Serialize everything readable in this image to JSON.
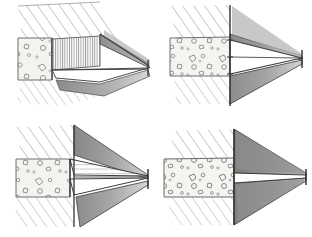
{
  "figure": {
    "medium": "graphite pencil drawing",
    "background_color": "#ffffff",
    "layout": {
      "rows": 2,
      "columns": 2,
      "panel_width": 156,
      "panel_height": 118
    },
    "ink_color": "#2b2b2b",
    "hatch_color": "#8c8c8c",
    "shade_light": "#c9c9c9",
    "shade_mid": "#a0a0a0",
    "shade_dark": "#6e6e6e",
    "aggregate_fill": "#f4f2ee",
    "void_fill": "#ffffff"
  },
  "panels": [
    {
      "id": "panel-top-left",
      "position": "top-left",
      "description": "Wide blunt wedge opening; aggregate block at left, fine vertical striations across the wedge face, long dark shaded flanks receding to the right.",
      "features": {
        "aggregate_zone": "left block with pebble inclusions",
        "hatched_zone": "diagonal hatching above and below",
        "striations": "dense vertical comb lines on wedge face",
        "wedge_type": "blunt / open",
        "tip_location": "right edge, mid height"
      }
    },
    {
      "id": "panel-top-right",
      "position": "top-right",
      "description": "Narrow sharp wedge; aggregate block at left with many pebbles, vertical boundary line, two dark shaded cones converging to a single sharp point at the right.",
      "features": {
        "aggregate_zone": "left block with pebble inclusions",
        "hatched_zone": "diagonal hatching above and below",
        "striations": "none",
        "wedge_type": "sharp / closed",
        "tip_location": "far right, mid height"
      }
    },
    {
      "id": "panel-bottom-left",
      "position": "bottom-left",
      "description": "Stepped double wedge; aggregate block at left, a short upper flap and a lower flap both tapering right to a common point, dark shading above and below.",
      "features": {
        "aggregate_zone": "left block with pebble inclusions",
        "hatched_zone": "diagonal hatching above and below",
        "striations": "light horizontal lines inside upper flap",
        "wedge_type": "stepped / double",
        "tip_location": "right edge, mid height"
      }
    },
    {
      "id": "panel-bottom-right",
      "position": "bottom-right",
      "description": "Thin slot wedge; broad aggregate block at left meets a straight vertical face, a slim white slot runs right between two heavy dark shaded masses to a point.",
      "features": {
        "aggregate_zone": "wide left block with pebble inclusions",
        "hatched_zone": "diagonal hatching above and below",
        "striations": "none",
        "wedge_type": "thin slot",
        "tip_location": "right edge, mid height"
      }
    }
  ]
}
